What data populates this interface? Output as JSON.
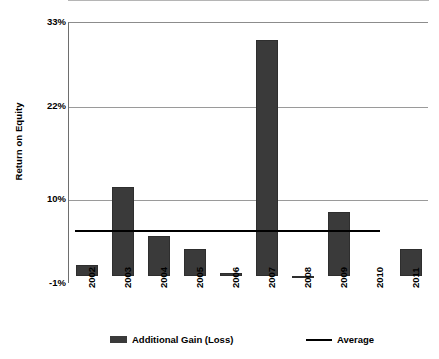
{
  "chart_data": {
    "type": "bar",
    "title": "",
    "subtitle": "",
    "xlabel": "",
    "ylabel": "Return on Equity",
    "categories": [
      "2002",
      "2003",
      "2004",
      "2005",
      "2006",
      "2007",
      "2008",
      "2009",
      "2010",
      "2011"
    ],
    "series": [
      {
        "name": "Additional Gain (Loss)",
        "type": "bar",
        "color": "#3a3a3a",
        "values": [
          1.5,
          11.7,
          5.3,
          3.6,
          0.4,
          30.8,
          -0.2,
          8.4,
          0.0,
          3.5
        ]
      },
      {
        "name": "Average",
        "type": "line",
        "color": "#000000",
        "value": 6.0
      }
    ],
    "ylim": [
      -1,
      33
    ],
    "yticks": [
      -1,
      10,
      22,
      33
    ],
    "ytick_labels": [
      "-1%",
      "10%",
      "22%",
      "33%"
    ],
    "grid": true,
    "grid_axis": "y",
    "legend_position": "bottom",
    "legend": [
      {
        "label": "Additional Gain (Loss)",
        "marker": "bar-swatch",
        "color": "#3a3a3a"
      },
      {
        "label": "Average",
        "marker": "line-swatch",
        "color": "#000000"
      }
    ],
    "axis_color": "#777777",
    "gridline_color": "#9a9a9a",
    "background": "#ffffff"
  }
}
